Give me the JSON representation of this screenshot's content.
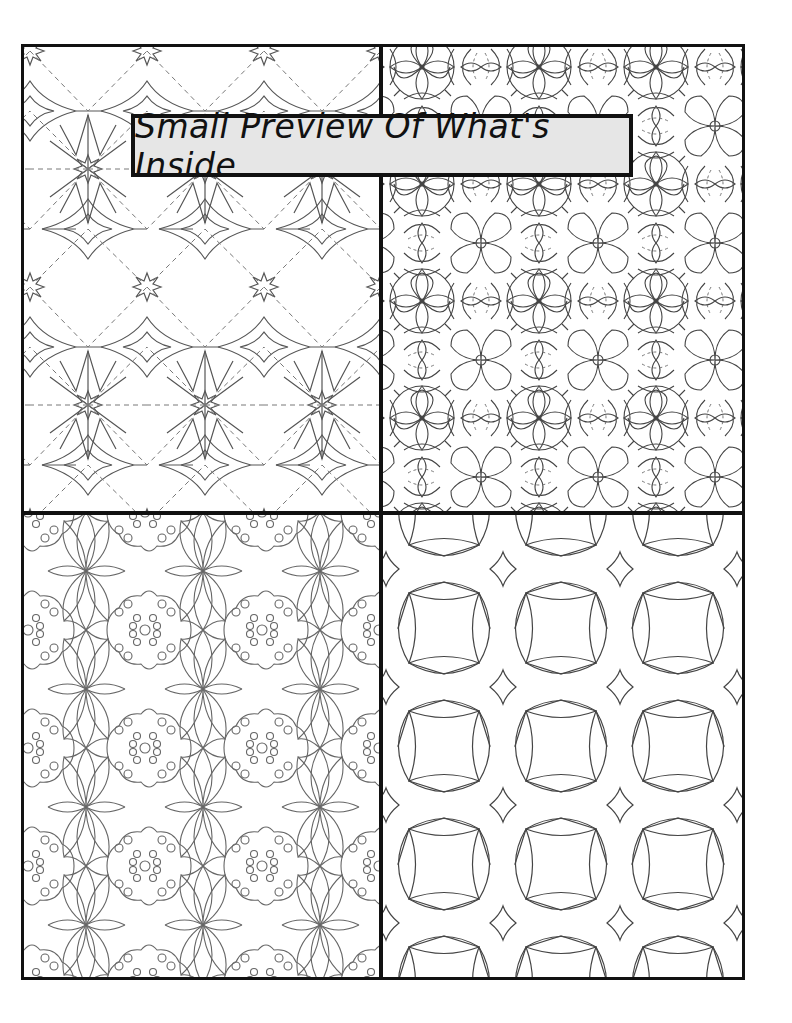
{
  "page": {
    "title": "Small Preview Of What's Inside",
    "border_color": "#111111",
    "title_background": "#e6e6e6",
    "line_color": "#555555"
  },
  "previews": [
    {
      "position": "top-left",
      "pattern": "star-lattice"
    },
    {
      "position": "top-right",
      "pattern": "floral-mandala-tile"
    },
    {
      "position": "bottom-left",
      "pattern": "circle-flower-lattice"
    },
    {
      "position": "bottom-right",
      "pattern": "curved-square-diamond"
    }
  ]
}
